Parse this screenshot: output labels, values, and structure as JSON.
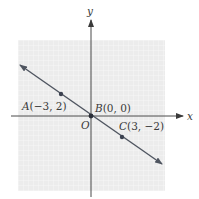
{
  "figure": {
    "axes": {
      "x_label": "x",
      "y_label": "y",
      "origin_label": "O"
    },
    "points": [
      {
        "name": "A",
        "label": "A(−3, 2)",
        "x": -3,
        "y": 2
      },
      {
        "name": "B",
        "label": "B(0, 0)",
        "x": 0,
        "y": 0
      },
      {
        "name": "C",
        "label": "C(3, −2)",
        "x": 3,
        "y": -2
      }
    ],
    "line": {
      "through": [
        "A",
        "B",
        "C"
      ],
      "slope": "-2/3",
      "arrows": "both"
    },
    "colors": {
      "grid_bg": "#ececec",
      "grid_line": "#ffffff",
      "axis": "#4a4a4a",
      "line": "#4f5560",
      "point": "#3c4250",
      "text": "#3a3a3a"
    }
  }
}
